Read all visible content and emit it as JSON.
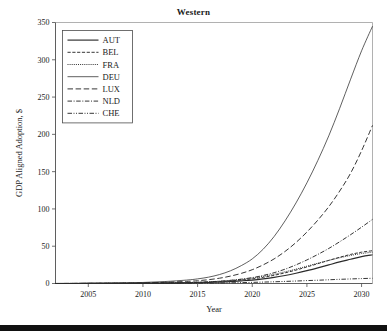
{
  "chart_data": {
    "type": "line",
    "title": "Western",
    "xlabel": "Year",
    "ylabel": "GDP Aligned Adoption, $",
    "xlim": [
      2002,
      2031
    ],
    "ylim": [
      0,
      350
    ],
    "xticks": [
      2005,
      2010,
      2015,
      2020,
      2025,
      2030
    ],
    "yticks": [
      0,
      50,
      100,
      150,
      200,
      250,
      300,
      350
    ],
    "grid": false,
    "legend_position": "upper-left",
    "x": [
      2002,
      2005,
      2008,
      2010,
      2012,
      2014,
      2015,
      2016,
      2017,
      2018,
      2019,
      2020,
      2021,
      2022,
      2023,
      2024,
      2025,
      2026,
      2027,
      2028,
      2029,
      2030,
      2031
    ],
    "series": [
      {
        "name": "AUT",
        "dash": "solid",
        "values": [
          0.0,
          0.1,
          0.2,
          0.3,
          0.5,
          0.8,
          1.0,
          1.4,
          1.9,
          2.6,
          3.5,
          4.6,
          6.2,
          8.2,
          10.8,
          13.8,
          17.2,
          21.0,
          25.0,
          29.0,
          32.5,
          36.0,
          38.5
        ]
      },
      {
        "name": "BEL",
        "dash": "dashed",
        "values": [
          0.0,
          0.1,
          0.2,
          0.4,
          0.7,
          1.1,
          1.4,
          1.9,
          2.6,
          3.5,
          4.7,
          6.2,
          8.3,
          11.0,
          14.3,
          18.0,
          22.2,
          26.6,
          31.0,
          35.2,
          39.0,
          42.0,
          44.0
        ]
      },
      {
        "name": "FRA",
        "dash": "dotted",
        "values": [
          0.0,
          0.1,
          0.3,
          0.5,
          0.8,
          1.3,
          1.7,
          2.3,
          3.1,
          4.2,
          5.6,
          7.3,
          9.6,
          12.4,
          15.7,
          19.3,
          23.2,
          27.2,
          31.0,
          34.5,
          37.6,
          40.2,
          42.0
        ]
      },
      {
        "name": "DEU",
        "dash": "thin-solid",
        "values": [
          0.1,
          0.3,
          0.8,
          1.4,
          2.6,
          4.6,
          6.2,
          8.5,
          12.0,
          17.0,
          24.0,
          33.0,
          46.0,
          63.0,
          84.0,
          108.0,
          135.0,
          165.0,
          198.0,
          235.0,
          274.0,
          312.0,
          345.0
        ]
      },
      {
        "name": "LUX",
        "dash": "long-dash",
        "values": [
          0.0,
          0.2,
          0.5,
          0.9,
          1.6,
          2.8,
          3.7,
          5.1,
          7.1,
          9.9,
          13.6,
          18.5,
          25.0,
          33.0,
          43.0,
          55.0,
          69.0,
          85.0,
          103.0,
          124.0,
          148.0,
          178.0,
          212.0
        ]
      },
      {
        "name": "NLD",
        "dash": "dash-dot",
        "values": [
          0.0,
          0.1,
          0.2,
          0.4,
          0.7,
          1.2,
          1.6,
          2.2,
          3.0,
          4.2,
          5.8,
          7.9,
          10.8,
          14.5,
          19.2,
          25.0,
          31.6,
          39.0,
          47.0,
          56.0,
          65.5,
          75.5,
          86.0
        ]
      },
      {
        "name": "CHE",
        "dash": "dash-dot-dot",
        "values": [
          0.0,
          0.0,
          0.1,
          0.1,
          0.2,
          0.3,
          0.4,
          0.5,
          0.7,
          0.9,
          1.2,
          1.5,
          1.9,
          2.3,
          2.8,
          3.3,
          3.9,
          4.4,
          5.0,
          5.6,
          6.1,
          6.6,
          7.0
        ]
      }
    ]
  },
  "legend": {
    "items": [
      {
        "label": "AUT"
      },
      {
        "label": "BEL"
      },
      {
        "label": "FRA"
      },
      {
        "label": "DEU"
      },
      {
        "label": "LUX"
      },
      {
        "label": "NLD"
      },
      {
        "label": "CHE"
      }
    ]
  },
  "colors": {
    "line": "#2b2b2b",
    "axis": "#4d4d4d",
    "background": "#ffffff",
    "footer_band": "#111111"
  }
}
